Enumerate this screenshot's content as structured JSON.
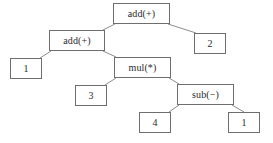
{
  "figure": {
    "kind": "expression-tree",
    "background_color": "#ffffff",
    "box_border_color": "#6e6e6e",
    "edge_color": "#8c8c8c",
    "text_color": "#2a2a2a"
  },
  "nodes": [
    {
      "id": "root-add",
      "label": "add(+)",
      "type": "operator",
      "x": 113,
      "y": 3,
      "w": 57,
      "h": 21
    },
    {
      "id": "add-2",
      "label": "add(+)",
      "type": "operator",
      "x": 49,
      "y": 30,
      "w": 56,
      "h": 21
    },
    {
      "id": "leaf-2",
      "label": "2",
      "type": "operand",
      "x": 194,
      "y": 33,
      "w": 32,
      "h": 21
    },
    {
      "id": "leaf-1a",
      "label": "1",
      "type": "operand",
      "x": 10,
      "y": 58,
      "w": 32,
      "h": 21
    },
    {
      "id": "mul",
      "label": "mul(*)",
      "type": "operator",
      "x": 114,
      "y": 57,
      "w": 57,
      "h": 21
    },
    {
      "id": "leaf-3",
      "label": "3",
      "type": "operand",
      "x": 75,
      "y": 85,
      "w": 32,
      "h": 21
    },
    {
      "id": "sub",
      "label": "sub(−)",
      "type": "operator",
      "x": 177,
      "y": 84,
      "w": 57,
      "h": 21
    },
    {
      "id": "leaf-4",
      "label": "4",
      "type": "operand",
      "x": 139,
      "y": 112,
      "w": 32,
      "h": 21
    },
    {
      "id": "leaf-1b",
      "label": "1",
      "type": "operand",
      "x": 228,
      "y": 112,
      "w": 32,
      "h": 21
    }
  ],
  "edges": [
    {
      "from": "root-add",
      "to": "add-2",
      "x1": 115,
      "y1": 24,
      "x2": 103,
      "y2": 30
    },
    {
      "from": "root-add",
      "to": "leaf-2",
      "x1": 168,
      "y1": 24,
      "x2": 196,
      "y2": 33
    },
    {
      "from": "add-2",
      "to": "leaf-1a",
      "x1": 51,
      "y1": 51,
      "x2": 40,
      "y2": 58
    },
    {
      "from": "add-2",
      "to": "mul",
      "x1": 103,
      "y1": 51,
      "x2": 116,
      "y2": 57
    },
    {
      "from": "mul",
      "to": "leaf-3",
      "x1": 116,
      "y1": 78,
      "x2": 105,
      "y2": 85
    },
    {
      "from": "mul",
      "to": "sub",
      "x1": 169,
      "y1": 78,
      "x2": 179,
      "y2": 84
    },
    {
      "from": "sub",
      "to": "leaf-4",
      "x1": 179,
      "y1": 105,
      "x2": 169,
      "y2": 112
    },
    {
      "from": "sub",
      "to": "leaf-1b",
      "x1": 232,
      "y1": 105,
      "x2": 244,
      "y2": 112
    }
  ]
}
